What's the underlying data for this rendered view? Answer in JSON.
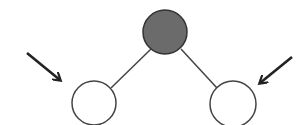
{
  "diagram": {
    "type": "tree",
    "nodes": [
      {
        "id": "root",
        "cx": 165,
        "cy": 32,
        "r": 22,
        "fill": "#6b6b6b",
        "stroke": "#333333"
      },
      {
        "id": "left-child",
        "cx": 94,
        "cy": 103,
        "r": 22,
        "fill": "#ffffff",
        "stroke": "#444444"
      },
      {
        "id": "right-child",
        "cx": 233,
        "cy": 104,
        "r": 23,
        "fill": "#ffffff",
        "stroke": "#444444"
      }
    ],
    "edges": [
      {
        "from": "root",
        "to": "left-child"
      },
      {
        "from": "root",
        "to": "right-child"
      }
    ],
    "arrows": [
      {
        "id": "left-arrow",
        "points_to": "left-child",
        "x1": 27,
        "y1": 53,
        "x2": 61,
        "y2": 81
      },
      {
        "id": "right-arrow",
        "points_to": "right-child",
        "x1": 292,
        "y1": 57,
        "x2": 259,
        "y2": 84
      }
    ],
    "colors": {
      "line": "#444444",
      "arrow": "#222222",
      "root_fill": "#6b6b6b",
      "child_fill": "#ffffff"
    }
  }
}
